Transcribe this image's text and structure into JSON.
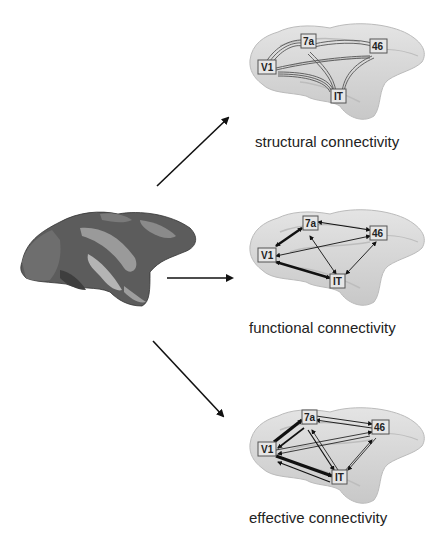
{
  "source": {
    "label": "",
    "description": "macaque brain surface (colored parcellation)"
  },
  "panels": [
    {
      "id": "structural",
      "caption": "structural connectivity"
    },
    {
      "id": "functional",
      "caption": "functional connectivity"
    },
    {
      "id": "effective",
      "caption": "effective connectivity"
    }
  ],
  "nodes": {
    "v1": "V1",
    "a7": "7a",
    "a46": "46",
    "it": "IT"
  },
  "colors": {
    "arrow": "#111111",
    "brain_light": "#d6d6d6",
    "brain_dark": "#5a5a5a",
    "node_fill": "#e0e0e0"
  }
}
